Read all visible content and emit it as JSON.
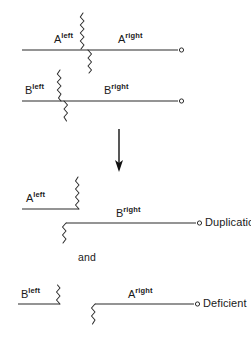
{
  "figure": {
    "title_visible": false,
    "background_color": "#ffffff",
    "line_color": "#2b2b2b",
    "text_color": "#1a1a1a"
  },
  "panels": [
    {
      "id": "pairing-panel",
      "name": "paired-chromosomes",
      "rows": [
        {
          "id": "row-a",
          "left_label": {
            "base": "A",
            "sup": "left"
          },
          "right_label": {
            "base": "A",
            "sup": "right"
          },
          "terminal": "open-circle"
        },
        {
          "id": "row-b",
          "left_label": {
            "base": "B",
            "sup": "left"
          },
          "right_label": {
            "base": "B",
            "sup": "right"
          },
          "terminal": "open-circle"
        }
      ]
    },
    {
      "id": "duplication-panel",
      "name": "duplication-product",
      "left_label": {
        "base": "A",
        "sup": "left"
      },
      "right_label": {
        "base": "B",
        "sup": "right"
      },
      "outcome": "Duplication",
      "terminal": "open-circle"
    },
    {
      "id": "deficient-panel",
      "name": "deficient-product",
      "left_label": {
        "base": "B",
        "sup": "left"
      },
      "right_label": {
        "base": "A",
        "sup": "right"
      },
      "outcome": "Deficient",
      "terminal": "open-circle"
    }
  ],
  "labels": {
    "a_left_base": "A",
    "a_left_sup": "left",
    "a_right_base": "A",
    "a_right_sup": "right",
    "b_left_base": "B",
    "b_left_sup": "left",
    "b_right_base": "B",
    "b_right_sup": "right",
    "dup_left_base": "A",
    "dup_left_sup": "left",
    "dup_right_base": "B",
    "dup_right_sup": "right",
    "def_left_base": "B",
    "def_left_sup": "left",
    "def_right_base": "A",
    "def_right_sup": "right",
    "duplication": "Duplication",
    "deficient": "Deficient",
    "conjunction": "and"
  },
  "arrow": {
    "name": "downward-arrow",
    "direction": "down"
  }
}
